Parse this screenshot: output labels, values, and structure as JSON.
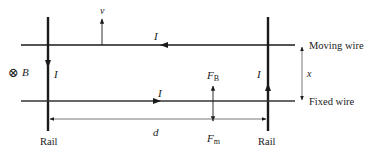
{
  "diagram": {
    "labels": {
      "velocity": "v",
      "current_top": "I",
      "current_left": "I",
      "current_bottom": "I",
      "current_right": "I",
      "field_symbol": "⊗",
      "field_label": "B",
      "force_magnetic": "F",
      "force_magnetic_sub": "B",
      "force_mechanical": "F",
      "force_mechanical_sub": "m",
      "distance_d": "d",
      "distance_x": "x",
      "moving_wire": "Moving wire",
      "fixed_wire": "Fixed wire",
      "rail_left": "Rail",
      "rail_right": "Rail"
    },
    "colors": {
      "line": "#1a1a1a",
      "thin_line": "#333333",
      "background": "#ffffff"
    }
  }
}
